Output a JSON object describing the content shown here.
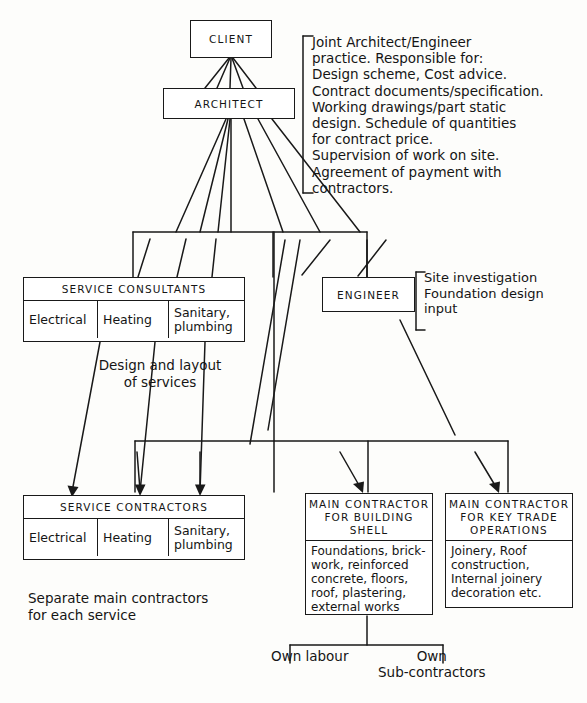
{
  "diagram": {
    "ink_color": "#191919",
    "paper_color": "#fdfdfb"
  },
  "nodes": {
    "client": {
      "title": "CLIENT"
    },
    "architect": {
      "title": "ARCHITECT"
    },
    "engineer": {
      "title": "ENGINEER"
    },
    "service_consultants": {
      "title": "SERVICE  CONSULTANTS",
      "cells": [
        "Electrical",
        "Heating",
        "Sanitary,\nplumbing"
      ]
    },
    "service_contractors": {
      "title": "SERVICE  CONTRACTORS",
      "cells": [
        "Electrical",
        "Heating",
        "Sanitary,\nplumbing"
      ]
    },
    "main_contractor_building_shell": {
      "title": "MAIN CONTRACTOR\nFOR BUILDING\nSHELL",
      "body": "Foundations, brick-\nwork, reinforced\nconcrete, floors,\nroof, plastering,\nexternal works"
    },
    "main_contractor_key_trades": {
      "title": "MAIN CONTRACTOR\nFOR KEY TRADE\nOPERATIONS",
      "body": "Joinery, Roof\nconstruction,\nInternal joinery\ndecoration etc."
    }
  },
  "annotations": {
    "architect_responsibilities": "Joint Architect/Engineer\npractice.  Responsible for:\nDesign scheme, Cost advice.\nContract documents/specification.\nWorking drawings/part static\ndesign.  Schedule of quantities\nfor contract price.\nSupervision of work on site.\nAgreement  of payment with\ncontractors.",
    "engineer_scope": "Site investigation\nFoundation design\ninput",
    "services_note": "Design and layout\nof services",
    "separate_contractors_note": "Separate main contractors\nfor each service",
    "own_labour": "Own labour",
    "own_subcontractors": "Own\nSub-contractors"
  }
}
